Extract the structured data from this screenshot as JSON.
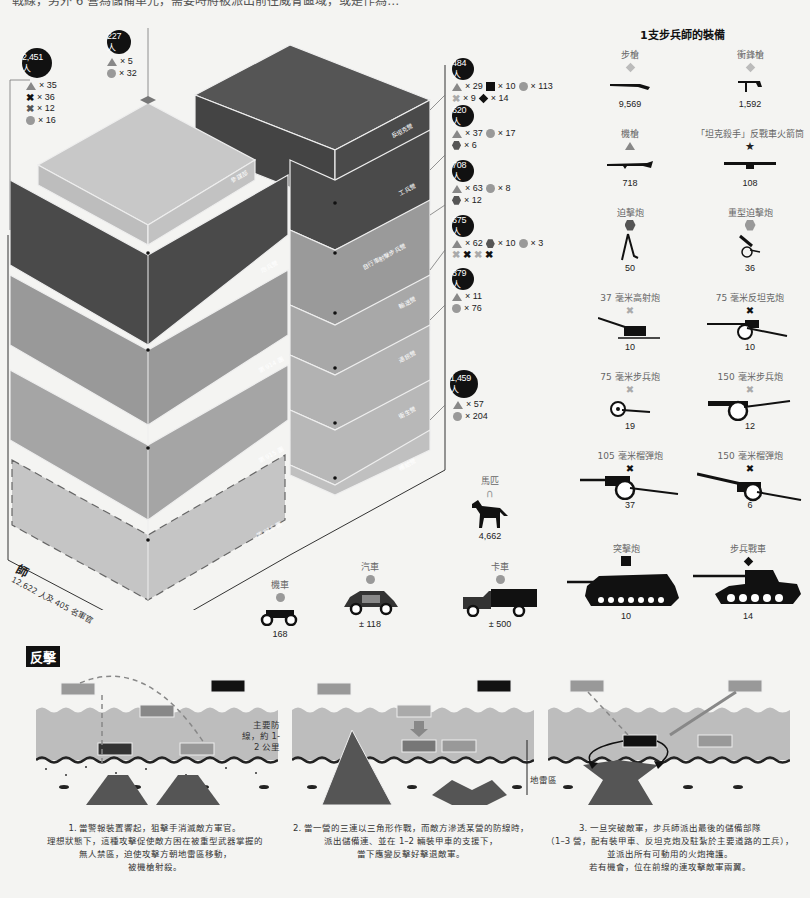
{
  "header": {
    "cut_text": "戰線，另外 6 營為儲備單元，需要時將被派出前往威脅區域，或是作為…"
  },
  "division": {
    "name": "師",
    "subtitle": "12,622 人及 405 名軍官",
    "colors": {
      "dark": "#4a4a4a",
      "mid": "#8f8f8f",
      "light": "#b0b0b0",
      "lighter": "#c8c8c8"
    },
    "blocks_left": [
      {
        "label": "參謀部"
      },
      {
        "label": "炮兵營"
      },
      {
        "label": "第 914 團"
      },
      {
        "label": "第 915 團"
      },
      {
        "label": "第 916 團"
      }
    ],
    "blocks_right": [
      {
        "label": "反坦克營"
      },
      {
        "label": "工兵營"
      },
      {
        "label": "自行車射擊步兵營"
      },
      {
        "label": "輸送營"
      },
      {
        "label": "通訊營"
      },
      {
        "label": "衛生營"
      },
      {
        "label": "補給營"
      }
    ]
  },
  "personnel": [
    {
      "count": "2,451 人",
      "items": [
        {
          "icon": "triangle",
          "value": "× 35"
        },
        {
          "icon": "cross-black",
          "value": "× 36"
        },
        {
          "icon": "cross-black",
          "value": "× 12"
        },
        {
          "icon": "circle",
          "value": "× 16"
        }
      ]
    },
    {
      "count": "227 人",
      "items": [
        {
          "icon": "triangle",
          "value": "× 5"
        },
        {
          "icon": "circle",
          "value": "× 32"
        }
      ]
    },
    {
      "count": "484 人",
      "items": [
        {
          "icon": "triangle",
          "value": "× 29"
        },
        {
          "icon": "square",
          "value": "× 10"
        },
        {
          "icon": "circle",
          "value": "× 113"
        },
        {
          "icon": "cross-gray",
          "value": "× 9"
        },
        {
          "icon": "diamond",
          "value": "× 14"
        }
      ]
    },
    {
      "count": "620 人",
      "items": [
        {
          "icon": "triangle",
          "value": "× 37"
        },
        {
          "icon": "circle",
          "value": "× 17"
        },
        {
          "icon": "hexagon",
          "value": "× 6"
        }
      ]
    },
    {
      "count": "708 人",
      "items": [
        {
          "icon": "triangle",
          "value": "× 63"
        },
        {
          "icon": "circle",
          "value": "× 8"
        },
        {
          "icon": "hexagon",
          "value": "× 12"
        }
      ]
    },
    {
      "count": "675 人",
      "items": [
        {
          "icon": "triangle",
          "value": "× 62"
        },
        {
          "icon": "hexagon",
          "value": "× 10"
        },
        {
          "icon": "circle",
          "value": "× 3"
        }
      ],
      "extra_crosses": [
        "gray",
        "black",
        "gray",
        "black"
      ]
    },
    {
      "count": "379 人",
      "items": [
        {
          "icon": "triangle",
          "value": "× 11"
        },
        {
          "icon": "circle",
          "value": "× 76"
        }
      ]
    },
    {
      "count": "1,459 人",
      "items": [
        {
          "icon": "triangle",
          "value": "× 57"
        },
        {
          "icon": "circle",
          "value": "× 204"
        }
      ]
    }
  ],
  "equipment": {
    "title": "1支步兵師的裝備",
    "items": [
      {
        "label": "步槍",
        "marker": "diamond-gray",
        "count": "9,569"
      },
      {
        "label": "衝鋒槍",
        "marker": "diamond-gray",
        "count": "1,592"
      },
      {
        "label": "機槍",
        "marker": "triangle",
        "count": "718"
      },
      {
        "label": "「坦克殺手」反戰車火箭筒",
        "marker": "star",
        "count": "108"
      },
      {
        "label": "迫擊炮",
        "marker": "hexagon-dark",
        "count": "50"
      },
      {
        "label": "重型迫擊炮",
        "marker": "hexagon-gray",
        "count": "36"
      },
      {
        "label": "37 毫米高射炮",
        "marker": "cross-gray",
        "count": "10"
      },
      {
        "label": "75 毫米反坦克炮",
        "marker": "cross-black",
        "count": "10"
      },
      {
        "label": "75 毫米步兵炮",
        "marker": "cross-gray",
        "count": "19"
      },
      {
        "label": "150 毫米步兵炮",
        "marker": "cross-gray",
        "count": "12"
      },
      {
        "label": "105 毫米榴彈炮",
        "marker": "cross-black",
        "count": "37"
      },
      {
        "label": "150 毫米榴彈炮",
        "marker": "cross-black",
        "count": "6"
      }
    ],
    "horses": {
      "label": "馬匹",
      "marker": "horseshoe",
      "count": "4,662"
    },
    "vehicles": [
      {
        "label": "機車",
        "marker": "circle",
        "count": "168"
      },
      {
        "label": "汽車",
        "marker": "circle",
        "count": "± 118"
      },
      {
        "label": "卡車",
        "marker": "circle",
        "count": "± 500"
      },
      {
        "label": "突擊炮",
        "marker": "square",
        "count": "10"
      },
      {
        "label": "步兵戰車",
        "marker": "diamond",
        "count": "14"
      }
    ]
  },
  "counterattack": {
    "title": "反擊",
    "main_line_label": "主要防線，約 1-2 公里",
    "minefield_label": "地雷區",
    "panels": [
      {
        "caption": [
          "1. 當警報裝置響起，狙擊手消滅敵方軍官。",
          "理想狀態下，這種攻擊促使敵方困在被重型武器掌握的",
          "無人禁區，迫使攻擊方朝地雷區移動，",
          "被機槍射殺。"
        ]
      },
      {
        "caption": [
          "2. 當一營的三連以三角形作戰，而敵方滲透某營的防線時，",
          "派出儲備連、並在 1–2 輛裝甲車的支援下，",
          "當下應變反擊好擊退敵軍。"
        ]
      },
      {
        "caption": [
          "3. 一旦突破敵軍，步兵師派出最後的儲備部隊",
          "（1–3 營，配有裝甲車、反坦克炮及駐紮於主要道路的工兵），",
          "並派出所有可動用的火炮掩護。",
          "若有機會，位在前線的連攻擊敵軍兩翼。"
        ]
      }
    ]
  }
}
